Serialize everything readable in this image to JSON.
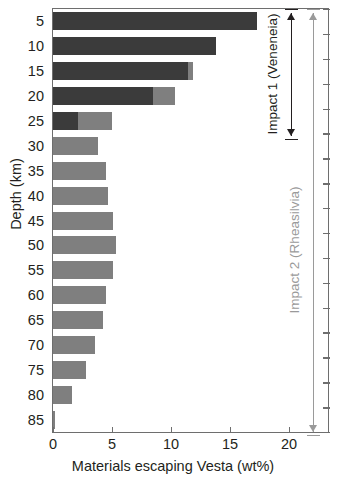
{
  "chart_data": {
    "type": "bar",
    "orientation": "horizontal",
    "title": "",
    "xlabel": "Materials escaping Vesta (wt%)",
    "ylabel": "Depth (km)",
    "xlim": [
      0,
      23.3
    ],
    "xticks": [
      0,
      5,
      10,
      15,
      20
    ],
    "xtick_labels": [
      "0",
      "5",
      "10",
      "15",
      "20"
    ],
    "grid": false,
    "legend": "none",
    "categories": [
      5,
      10,
      15,
      20,
      25,
      30,
      35,
      40,
      45,
      50,
      55,
      60,
      65,
      70,
      75,
      80,
      85
    ],
    "category_labels": [
      "5",
      "10",
      "15",
      "20",
      "25",
      "30",
      "35",
      "40",
      "45",
      "50",
      "55",
      "60",
      "65",
      "70",
      "75",
      "80",
      "85"
    ],
    "stacked": true,
    "series": [
      {
        "name": "Impact 1 (Veneneia)",
        "color": "#3b3b3b",
        "values": [
          17.3,
          13.8,
          11.4,
          8.5,
          2.1,
          0,
          0,
          0,
          0,
          0,
          0,
          0,
          0,
          0,
          0,
          0,
          0
        ]
      },
      {
        "name": "Impact 2 (Rheasilvia)",
        "color": "#7f7f7f",
        "values": [
          0,
          0,
          0.5,
          1.8,
          2.9,
          3.8,
          4.5,
          4.7,
          5.1,
          5.3,
          5.1,
          4.5,
          4.2,
          3.6,
          2.8,
          1.6,
          0.2
        ]
      }
    ],
    "annotations": [
      {
        "text": "Impact 1 (Veneneia)",
        "color": "#231f20",
        "style": "double-arrow",
        "depth_range": [
          5,
          25
        ]
      },
      {
        "text": "Impact 2 (Rheasilvia)",
        "color": "#9a9a9a",
        "style": "double-arrow",
        "depth_range": [
          5,
          85
        ]
      }
    ]
  },
  "axes": {
    "y_title": "Depth (km)",
    "x_title": "Materials escaping Vesta (wt%)",
    "y_tick_labels": [
      "5",
      "10",
      "15",
      "20",
      "25",
      "30",
      "35",
      "40",
      "45",
      "50",
      "55",
      "60",
      "65",
      "70",
      "75",
      "80",
      "85"
    ],
    "x_tick_labels": [
      "0",
      "5",
      "10",
      "15",
      "20"
    ]
  },
  "annotations": {
    "impact1": "Impact 1 (Veneneia)",
    "impact2": "Impact 2 (Rheasilvia)"
  },
  "colors": {
    "bar_dark": "#3b3b3b",
    "bar_gray": "#7f7f7f",
    "frame": "#6e6e6e",
    "text": "#231f20",
    "annotation_gray": "#9a9a9a"
  }
}
